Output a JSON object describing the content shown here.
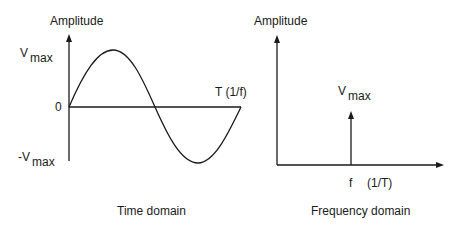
{
  "time_domain": {
    "y_label": "Amplitude",
    "v_max_main": "V",
    "v_max_sub": "max",
    "neg_v_max_main": "-V",
    "neg_v_max_sub": "max",
    "zero_label": "0",
    "period_label": "T (1/f)",
    "caption": "Time domain"
  },
  "frequency_domain": {
    "y_label": "Amplitude",
    "spike_main": "V",
    "spike_sub": "max",
    "freq_label": "f",
    "freq_paren": "(1/T)",
    "caption": "Frequency domain"
  },
  "colors": {
    "stroke": "#1a1a1a",
    "background": "#ffffff"
  }
}
